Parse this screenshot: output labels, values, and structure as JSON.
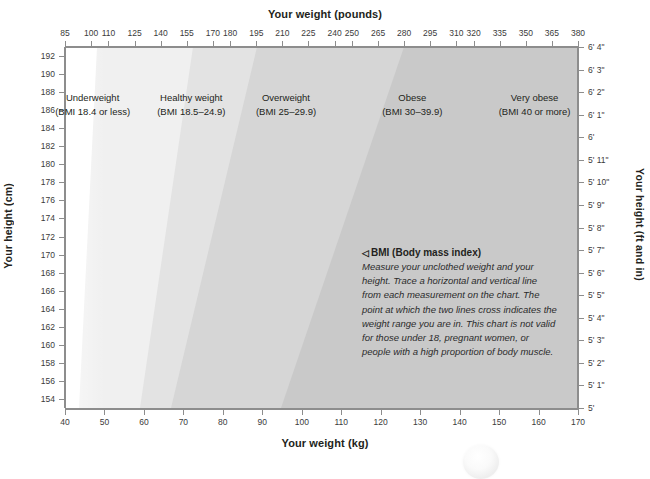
{
  "chart_data": {
    "type": "area",
    "top_axis": {
      "label": "Your weight (pounds)",
      "ticks": [
        85,
        100,
        110,
        125,
        140,
        155,
        170,
        180,
        195,
        210,
        225,
        240,
        250,
        265,
        280,
        295,
        310,
        320,
        335,
        350,
        365,
        380
      ],
      "range": [
        85,
        380
      ]
    },
    "bottom_axis": {
      "label": "Your weight (kg)",
      "ticks": [
        40,
        50,
        60,
        70,
        80,
        90,
        100,
        110,
        120,
        130,
        140,
        150,
        160,
        170
      ],
      "range": [
        40,
        170
      ]
    },
    "left_axis": {
      "label": "Your height (cm)",
      "ticks": [
        192,
        190,
        188,
        186,
        184,
        182,
        180,
        178,
        176,
        174,
        172,
        170,
        168,
        166,
        164,
        162,
        160,
        158,
        156,
        154
      ],
      "range": [
        153,
        193
      ]
    },
    "right_axis": {
      "label": "Your height (ft and in)",
      "ticks": [
        "6' 4\"",
        "6' 3\"",
        "6' 2\"",
        "6' 1\"",
        "6'",
        "5' 11\"",
        "5' 10\"",
        "5' 9\"",
        "5' 8\"",
        "5' 7\"",
        "5' 6\"",
        "5' 5\"",
        "5' 4\"",
        "5' 3\"",
        "5' 2\"",
        "5' 1\"",
        "5'"
      ]
    },
    "bands": [
      {
        "name": "Underweight",
        "detail": "(BMI 18.4 or less)",
        "bmi_max": 18.4,
        "color": "#ffffff",
        "label_x_kg": 47,
        "boundary_kg_at_154cm": 43.6,
        "boundary_kg_at_193cm": 68.5
      },
      {
        "name": "Healthy weight",
        "detail": "(BMI 18.5–24.9)",
        "bmi_min": 18.5,
        "bmi_max": 24.9,
        "color": "#f0f0f0",
        "label_x_kg": 72,
        "boundary_kg_at_154cm": 59.0,
        "boundary_kg_at_193cm": 92.7
      },
      {
        "name": "Overweight",
        "detail": "(BMI 25–29.9)",
        "bmi_min": 25,
        "bmi_max": 29.9,
        "color": "#e3e3e3",
        "label_x_kg": 96,
        "boundary_kg_at_154cm": 70.9,
        "boundary_kg_at_193cm": 111.4
      },
      {
        "name": "Obese",
        "detail": "(BMI 30–39.9)",
        "bmi_min": 30,
        "bmi_max": 39.9,
        "color": "#d6d6d6",
        "label_x_kg": 128,
        "boundary_kg_at_154cm": 94.6,
        "boundary_kg_at_193cm": 148.6
      },
      {
        "name": "Very obese",
        "detail": "(BMI 40 or more)",
        "bmi_min": 40,
        "color": "#c9c9c9",
        "label_x_kg": 159
      }
    ],
    "grid": false,
    "legend": "inline-band-labels"
  },
  "annotation": {
    "marker": "◁",
    "title": "BMI (Body mass index)",
    "body": "Measure your unclothed weight and your height. Trace a horizontal and vertical line from each measurement on the chart. The point at which the two lines cross indicates the weight range you are in. This chart is not valid for those under 18, pregnant women, or people with a high proportion of body muscle."
  },
  "colors": {
    "axis": "#8d8d8d",
    "text": "#231f20",
    "tick_text": "#3b3b3b",
    "band_1": "#ffffff",
    "band_2": "#f0f0f0",
    "band_3": "#e3e3e3",
    "band_4": "#d6d6d6",
    "band_5": "#c9c9c9"
  }
}
